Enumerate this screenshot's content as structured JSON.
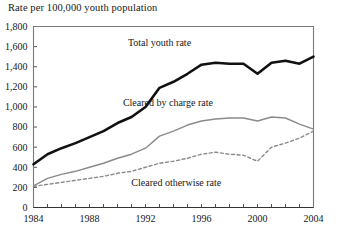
{
  "chart_data": {
    "type": "line",
    "title": "Rate per 100,000 youth population",
    "xlabel": "",
    "ylabel": "Rate per 100,000 youth population",
    "xlim": [
      1984,
      2004
    ],
    "ylim": [
      0,
      1800
    ],
    "ytick_step": 200,
    "xtick_step": 1,
    "xtick_label_step": 4,
    "grid": false,
    "legend_position": "inline-annotations",
    "x": [
      1984,
      1985,
      1986,
      1987,
      1988,
      1989,
      1990,
      1991,
      1992,
      1993,
      1994,
      1995,
      1996,
      1997,
      1998,
      1999,
      2000,
      2001,
      2002,
      2003,
      2004
    ],
    "ytick_labels": [
      "0",
      "200",
      "400",
      "600",
      "800",
      "1,000",
      "1,200",
      "1,400",
      "1,600",
      "1,800"
    ],
    "ytick_values": [
      0,
      200,
      400,
      600,
      800,
      1000,
      1200,
      1400,
      1600,
      1800
    ],
    "xtick_labels": [
      "1984",
      "1988",
      "1992",
      "1996",
      "2000",
      "2004"
    ],
    "xtick_values": [
      1984,
      1988,
      1992,
      1996,
      2000,
      2004
    ],
    "series": [
      {
        "name": "Total youth rate",
        "label": "Total youth rate",
        "color": "#111111",
        "style": "solid",
        "width": 2.6,
        "label_x": 1993.0,
        "label_y": 1610,
        "values": [
          430,
          530,
          590,
          640,
          700,
          760,
          840,
          900,
          1000,
          1190,
          1250,
          1330,
          1420,
          1440,
          1430,
          1430,
          1330,
          1440,
          1460,
          1430,
          1500
        ]
      },
      {
        "name": "Cleared by charge rate",
        "label": "Cleared by charge rate",
        "color": "#8a8a8a",
        "style": "solid",
        "width": 1.4,
        "label_x": 1993.6,
        "label_y": 1010,
        "values": [
          215,
          290,
          330,
          360,
          400,
          440,
          490,
          530,
          590,
          710,
          760,
          820,
          860,
          880,
          890,
          890,
          860,
          900,
          890,
          830,
          780
        ]
      },
      {
        "name": "Cleared otherwise rate",
        "label": "Cleared otherwise rate",
        "color": "#8a8a8a",
        "style": "dashed",
        "width": 1.4,
        "label_x": 1994.2,
        "label_y": 215,
        "values": [
          210,
          230,
          250,
          270,
          290,
          310,
          340,
          360,
          400,
          440,
          460,
          490,
          530,
          550,
          530,
          520,
          460,
          600,
          640,
          690,
          760
        ]
      }
    ]
  }
}
